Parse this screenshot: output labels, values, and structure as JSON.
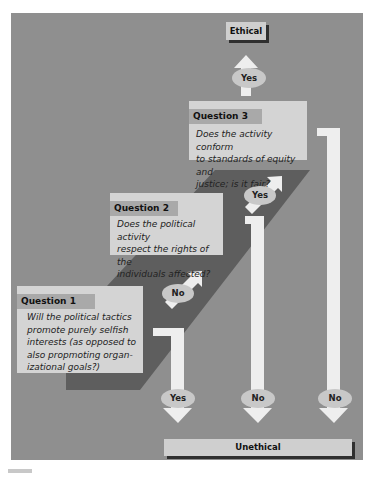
{
  "diagram": {
    "type": "decision-flowchart",
    "colors": {
      "background": "#8f8f8f",
      "diagonal_band": "#5e5e5e",
      "box": "#d4d4d4",
      "label_bar": "#a9a9a9",
      "arrow": "#eeeeee",
      "shadow": "#2f2f2f"
    },
    "questions": [
      {
        "label": "Question 1",
        "text_lines": [
          "Will the political tactics",
          "promote purely selfish",
          "interests (as opposed to",
          "also propmoting organ-",
          "izational goals?)"
        ]
      },
      {
        "label": "Question 2",
        "text_lines": [
          "Does the political activity",
          "respect the rights of the",
          "individuals affected?"
        ]
      },
      {
        "label": "Question 3",
        "text_lines": [
          "Does the activity conform",
          "to standards of equity and",
          "justice; is it fair?"
        ]
      }
    ],
    "edges": [
      {
        "from": "Question 1",
        "label": "No",
        "to": "Question 2"
      },
      {
        "from": "Question 1",
        "label": "Yes",
        "to": "Unethical"
      },
      {
        "from": "Question 2",
        "label": "Yes",
        "to": "Question 3"
      },
      {
        "from": "Question 2",
        "label": "No",
        "to": "Unethical"
      },
      {
        "from": "Question 3",
        "label": "Yes",
        "to": "Ethical"
      },
      {
        "from": "Question 3",
        "label": "No",
        "to": "Unethical"
      }
    ],
    "outcomes": {
      "ethical": "Ethical",
      "unethical": "Unethical"
    }
  }
}
